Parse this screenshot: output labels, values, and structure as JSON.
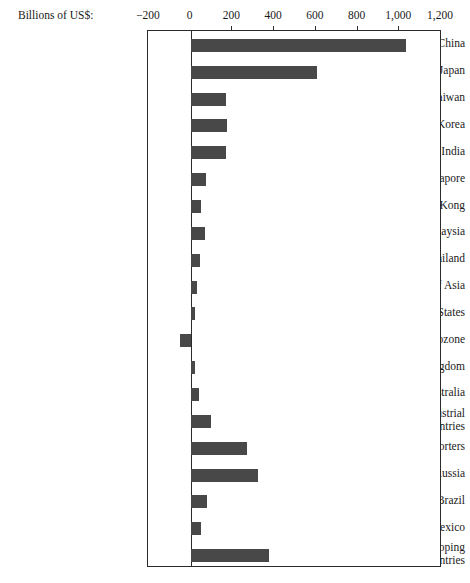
{
  "chart_data": {
    "type": "bar",
    "orientation": "horizontal",
    "title": "",
    "xlabel": "Billions of US$:",
    "ylabel": "",
    "xlim": [
      -200,
      1200
    ],
    "xticks": [
      -200,
      0,
      200,
      400,
      600,
      800,
      1000,
      1200
    ],
    "xtick_labels": [
      "−200",
      "0",
      "200",
      "400",
      "600",
      "800",
      "1,000",
      "1,200"
    ],
    "grid": false,
    "legend": false,
    "bar_color": "#484848",
    "frame_color": "#2b2b2b",
    "categories": [
      "China",
      "Japan",
      "Taiwan",
      "South Korea",
      "India",
      "Singapore",
      "Hong Kong",
      "Malaysia",
      "Thailand",
      "Rest of Asia",
      "United States",
      "Eurozone",
      "United Kingdom",
      "Australia",
      "Other industrial countries",
      "Oil exporters",
      "Russia",
      "Brazil",
      "Mexico",
      "Other developing countries"
    ],
    "category_lines": [
      [
        "China"
      ],
      [
        "Japan"
      ],
      [
        "Taiwan"
      ],
      [
        "South Korea"
      ],
      [
        "India"
      ],
      [
        "Singapore"
      ],
      [
        "Hong Kong"
      ],
      [
        "Malaysia"
      ],
      [
        "Thailand"
      ],
      [
        "Rest of Asia"
      ],
      [
        "United States"
      ],
      [
        "Eurozone"
      ],
      [
        "United Kingdom"
      ],
      [
        "Australia"
      ],
      [
        "Other industrial",
        "countries"
      ],
      [
        "Oil exporters"
      ],
      [
        "Russia"
      ],
      [
        "Brazil"
      ],
      [
        "Mexico"
      ],
      [
        "Other developing",
        "countries"
      ]
    ],
    "values": [
      1030,
      605,
      170,
      172,
      170,
      75,
      48,
      68,
      45,
      30,
      22,
      -50,
      22,
      40,
      95,
      270,
      325,
      80,
      48,
      375
    ]
  }
}
